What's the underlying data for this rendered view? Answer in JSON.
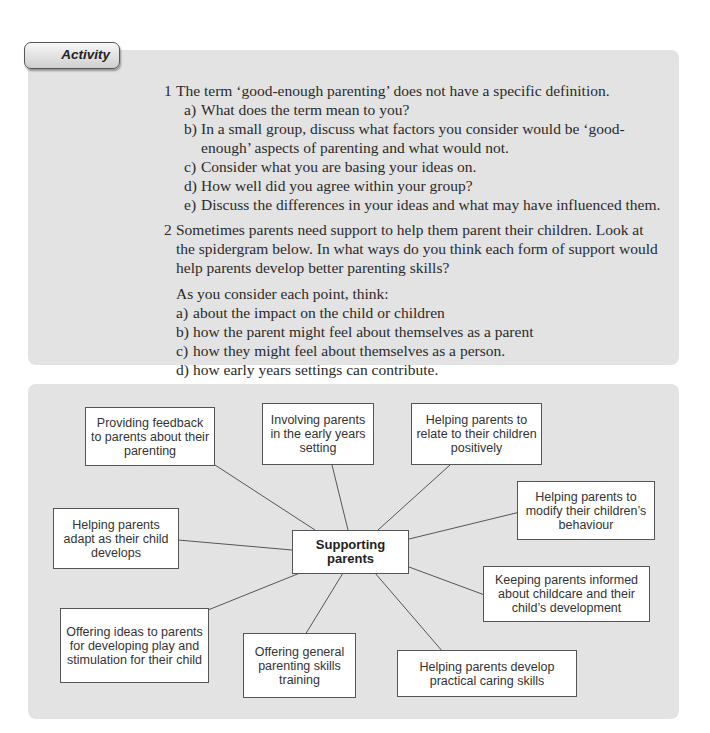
{
  "activity": {
    "tab_label": "Activity",
    "q1": {
      "num": "1",
      "text": "The term ‘good-enough parenting’ does not have a specific definition.",
      "items": [
        {
          "label": "a)",
          "text": "What does the term mean to you?"
        },
        {
          "label": "b)",
          "text": "In a small group, discuss what factors you consider would be ‘good-",
          "cont": "enough’ aspects of parenting and what would not."
        },
        {
          "label": "c)",
          "text": "Consider what you are basing your ideas on."
        },
        {
          "label": "d)",
          "text": "How well did you agree within your group?"
        },
        {
          "label": "e)",
          "text": "Discuss the differences in your ideas and what may have influenced them."
        }
      ]
    },
    "q2": {
      "num": "2",
      "lines": [
        "Sometimes parents need support to help them parent their children. Look at",
        "the spidergram below. In what ways do you think each form of support would",
        "help parents develop better parenting skills?"
      ],
      "intro": "As you consider each point, think:",
      "items": [
        {
          "label": "a)",
          "text": "about the impact on the child or children"
        },
        {
          "label": "b)",
          "text": "how the parent might feel about themselves as a parent"
        },
        {
          "label": "c)",
          "text": "how they might feel about themselves as a person."
        },
        {
          "label": "d)",
          "text": "how early years settings can contribute."
        }
      ]
    }
  },
  "spidergram": {
    "center": "Supporting parents",
    "nodes": [
      "Providing feedback to parents about their parenting",
      "Involving parents in the early years setting",
      "Helping parents to relate to their children positively",
      "Helping parents to modify their children’s behaviour",
      "Keeping parents informed about childcare and their child’s development",
      "Helping parents develop practical caring skills",
      "Offering general parenting skills training",
      "Offering ideas to parents for developing play and stimulation for their child",
      "Helping parents adapt as their child develops"
    ],
    "colors": {
      "panel": "#e3e3e3",
      "box_border": "#555555",
      "line": "#555555"
    }
  }
}
